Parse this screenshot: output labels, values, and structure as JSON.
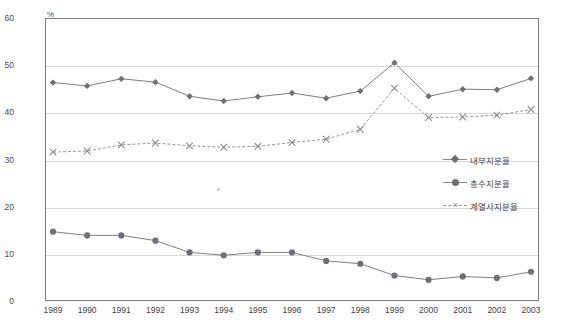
{
  "title": "",
  "axis": {
    "y_unit": "%",
    "y_ticks": [
      "60",
      "50",
      "40",
      "30",
      "20",
      "10",
      "0"
    ]
  },
  "legend": {
    "items": [
      {
        "label": "내부지분율",
        "marker": "diamond-marker-icon",
        "color": "#6f6f78"
      },
      {
        "label": "총수지분율",
        "marker": "circle-marker-icon",
        "color": "#6f6f78"
      },
      {
        "label": "계열사지분율",
        "marker": "x-marker-icon",
        "color": "#8a8a92"
      }
    ]
  },
  "chart_data": {
    "type": "line",
    "title": "",
    "xlabel": "",
    "ylabel": "%",
    "ylim": [
      0,
      60
    ],
    "ytick_step": 10,
    "grid": true,
    "legend_position": "inside-right",
    "categories": [
      "1989",
      "1990",
      "1991",
      "1992",
      "1993",
      "1994",
      "1995",
      "1996",
      "1997",
      "1998",
      "1999",
      "2000",
      "2001",
      "2002",
      "2003"
    ],
    "series": [
      {
        "name": "내부지분율",
        "marker": "diamond",
        "color": "#6f6f78",
        "values": [
          46.3,
          45.6,
          47.1,
          46.4,
          43.4,
          42.4,
          43.3,
          44.1,
          43.0,
          44.5,
          50.5,
          43.4,
          44.9,
          44.8,
          47.2
        ]
      },
      {
        "name": "총수지분율",
        "marker": "circle",
        "color": "#6f6f78",
        "values": [
          14.7,
          13.9,
          13.9,
          12.8,
          10.3,
          9.7,
          10.3,
          10.3,
          8.5,
          7.9,
          5.4,
          4.5,
          5.2,
          4.9,
          6.2
        ]
      },
      {
        "name": "계열사지분율",
        "marker": "x",
        "color": "#8a8a92",
        "values": [
          31.6,
          31.8,
          33.1,
          33.5,
          32.9,
          32.6,
          32.8,
          33.6,
          34.3,
          36.4,
          45.1,
          38.9,
          39.0,
          39.4,
          40.6
        ]
      }
    ]
  }
}
